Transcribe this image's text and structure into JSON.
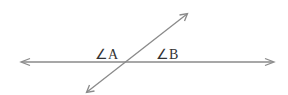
{
  "diagram": {
    "type": "intersecting-lines",
    "labels": {
      "angle_a": "∠A",
      "angle_b": "∠B"
    },
    "colors": {
      "line": "#8a8a8a",
      "text": "#333333"
    }
  }
}
